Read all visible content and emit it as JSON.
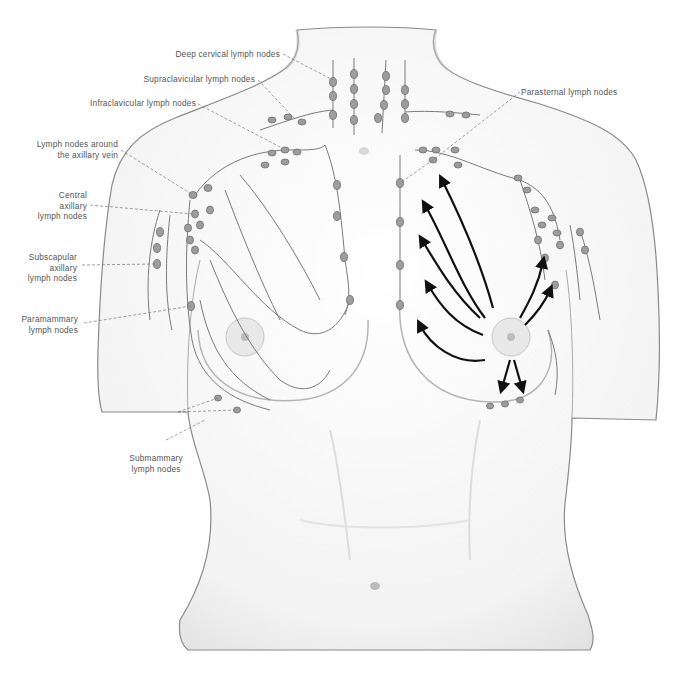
{
  "figure": {
    "colors": {
      "skin": "#f7f7f7",
      "outline": "#8a8a8a",
      "shading": "#d6d6d6",
      "lymph_vessel": "#7a7a7a",
      "lymph_node_fill": "#9d9d9d",
      "arrow": "#111111",
      "leader_line": "#777777",
      "label_text": "#555555"
    },
    "labels": [
      {
        "id": "deep-cervical",
        "text": "Deep cervical lymph nodes"
      },
      {
        "id": "supraclavicular",
        "text": "Supraclavicular lymph nodes"
      },
      {
        "id": "infraclavicular",
        "text": "Infraclavicular lymph nodes"
      },
      {
        "id": "axillary-vein",
        "line1": "Lymph nodes around",
        "line2": "the axillary vein"
      },
      {
        "id": "central-axillary",
        "line1": "Central",
        "line2": "axillary",
        "line3": "lymph nodes"
      },
      {
        "id": "subscapular",
        "line1": "Subscapular",
        "line2": "axillary",
        "line3": "lymph nodes"
      },
      {
        "id": "paramammary",
        "line1": "Paramammary",
        "line2": "lymph nodes"
      },
      {
        "id": "submammary",
        "line1": "Submammary",
        "line2": "lymph nodes"
      },
      {
        "id": "parasternal",
        "text": "Parasternal lymph nodes"
      }
    ],
    "arrows_description": "Black arrows on the left breast (viewer's right) show lymph flow from the nipple toward axillary, parasternal and submammary nodes"
  }
}
